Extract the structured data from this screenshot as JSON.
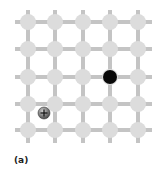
{
  "figure": {
    "caption": "(a)",
    "lattice": {
      "rows": 5,
      "cols": 5,
      "x_positions": [
        28,
        55,
        83,
        110,
        138
      ],
      "y_positions": [
        22,
        49,
        77,
        104,
        130
      ],
      "line_extent": {
        "x_min": 15,
        "x_max": 152,
        "y_min": 10,
        "y_max": 143
      },
      "node_radius": 8,
      "line_width": 4,
      "node_color": "#dcdcdc",
      "line_color": "#c4c4c4"
    },
    "electron": {
      "x": 110,
      "y": 77,
      "radius": 7,
      "color": "#0a0a0a"
    },
    "positive_ion": {
      "x": 44,
      "y": 113,
      "radius": 6,
      "color": "#808080",
      "symbol": "+"
    }
  }
}
